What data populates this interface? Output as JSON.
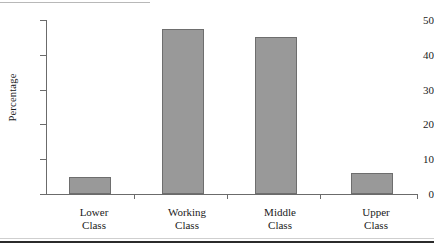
{
  "chart_data": {
    "type": "bar",
    "title": "",
    "xlabel": "",
    "ylabel": "Percentage",
    "categories": [
      "Lower Class",
      "Working Class",
      "Middle Class",
      "Upper Class"
    ],
    "category_lines": [
      [
        "Lower",
        "Class"
      ],
      [
        "Working",
        "Class"
      ],
      [
        "Middle",
        "Class"
      ],
      [
        "Upper",
        "Class"
      ]
    ],
    "values": [
      5,
      47.5,
      45,
      6
    ],
    "ylim": [
      0,
      50
    ],
    "yticks": [
      0,
      10,
      20,
      30,
      40,
      50
    ],
    "ytick_labels": [
      "0",
      "10",
      "20",
      "30",
      "40",
      "50"
    ],
    "grid": false,
    "legend": null,
    "bar_color": "#999999",
    "bar_border_color": "#6e6e6e",
    "axis_color": "#6b6b6b",
    "text_color": "#1a1a1a",
    "rule_color": "#2b2b2b"
  }
}
